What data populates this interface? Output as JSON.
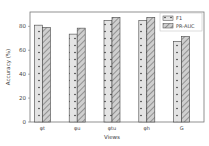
{
  "chart_data": {
    "type": "bar",
    "title": "",
    "xlabel": "Views",
    "ylabel": "Accuracy (%)",
    "ylim": [
      0,
      92
    ],
    "yticks": [
      0,
      20,
      40,
      60,
      80
    ],
    "categories": [
      "φt",
      "φu",
      "φtu",
      "φh",
      "G"
    ],
    "series": [
      {
        "name": "F1",
        "pattern": "dots",
        "values": [
          81,
          73.5,
          85,
          85,
          67.5
        ]
      },
      {
        "name": "PR-AUC",
        "pattern": "hatch",
        "values": [
          79,
          78.5,
          87.5,
          87.5,
          71.5
        ]
      }
    ],
    "legend_position": "upper right",
    "grid": false
  }
}
